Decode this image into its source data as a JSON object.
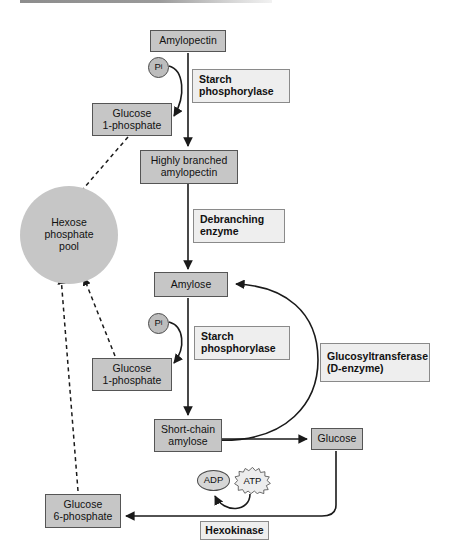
{
  "diagram": {
    "colors": {
      "metabolite_fill": "#c6c6c6",
      "metabolite_stroke": "#555555",
      "enzyme_fill": "#eeeeee",
      "enzyme_stroke": "#8a8a8a",
      "pool_fill": "#c6c6c6",
      "arrow_solid": "#1a1a1a",
      "arrow_dashed": "#1a1a1a",
      "background": "#ffffff"
    },
    "metabolites": [
      {
        "id": "amylopectin",
        "label": "Amylopectin"
      },
      {
        "id": "glucose-1-phosphate-top",
        "line1": "Glucose",
        "line2": "1-phosphate"
      },
      {
        "id": "highly-branched-amylopectin",
        "line1": "Highly branched",
        "line2": "amylopectin"
      },
      {
        "id": "amylose",
        "label": "Amylose"
      },
      {
        "id": "glucose-1-phosphate-bottom",
        "line1": "Glucose",
        "line2": "1-phosphate"
      },
      {
        "id": "short-chain-amylose",
        "line1": "Short-chain",
        "line2": "amylose"
      },
      {
        "id": "glucose",
        "label": "Glucose"
      },
      {
        "id": "glucose-6-phosphate",
        "line1": "Glucose",
        "line2": "6-phosphate"
      }
    ],
    "pool": {
      "id": "hexose-phosphate-pool",
      "line1": "Hexose",
      "line2": "phosphate",
      "line3": "pool"
    },
    "enzymes": [
      {
        "id": "starch-phosphorylase-top",
        "line1": "Starch",
        "line2": "phosphorylase"
      },
      {
        "id": "debranching-enzyme",
        "line1": "Debranching",
        "line2": "enzyme"
      },
      {
        "id": "starch-phosphorylase-bottom",
        "line1": "Starch",
        "line2": "phosphorylase"
      },
      {
        "id": "glucosyltransferase",
        "line1": "Glucosyltransferase",
        "line2": "(D-enzyme)"
      },
      {
        "id": "hexokinase",
        "label": "Hexokinase"
      }
    ],
    "cofactors": [
      {
        "id": "pi-top",
        "label": "P",
        "subscript": "i"
      },
      {
        "id": "pi-bottom",
        "label": "P",
        "subscript": "i"
      },
      {
        "id": "adp",
        "label": "ADP"
      },
      {
        "id": "atp",
        "label": "ATP"
      }
    ]
  }
}
